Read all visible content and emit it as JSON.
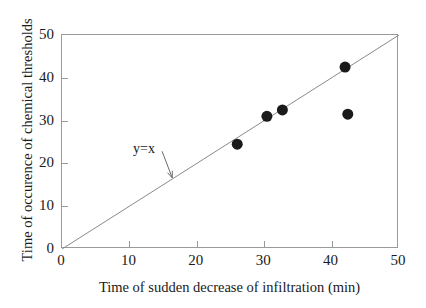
{
  "chart_data": {
    "type": "scatter",
    "title": "",
    "xlabel": "Time of sudden decrease of infiltration (min)",
    "ylabel": "Time of occurence of chemical thresholds",
    "xlim": [
      0,
      50
    ],
    "ylim": [
      0,
      50
    ],
    "xticks": [
      0,
      10,
      20,
      30,
      40,
      50
    ],
    "yticks": [
      0,
      10,
      20,
      30,
      40,
      50
    ],
    "xtick_labels": [
      "0",
      "10",
      "20",
      "30",
      "40",
      "50"
    ],
    "ytick_labels": [
      "0",
      "10",
      "20",
      "30",
      "40",
      "50"
    ],
    "grid": false,
    "legend": null,
    "marker": {
      "shape": "circle",
      "color": "#1a1a1a",
      "size_px": 11
    },
    "points": [
      {
        "x": 26.0,
        "y": 24.5
      },
      {
        "x": 30.4,
        "y": 31.0
      },
      {
        "x": 32.7,
        "y": 32.5
      },
      {
        "x": 42.0,
        "y": 42.5
      },
      {
        "x": 42.4,
        "y": 31.5
      }
    ],
    "reference_line": {
      "label": "y=x",
      "from": {
        "x": 0,
        "y": 0
      },
      "to": {
        "x": 50,
        "y": 50
      },
      "color": "#8a8a8a"
    },
    "annotations": [
      {
        "text": "y=x",
        "text_x": 11.0,
        "text_y": 25.5,
        "arrow_from": {
          "x": 15.0,
          "y": 22.6
        },
        "arrow_to": {
          "x": 16.5,
          "y": 16.4
        },
        "color": "#6b6b6b"
      }
    ]
  },
  "axes": {
    "frame_color": "#9a9a9a",
    "background": "#ffffff"
  }
}
